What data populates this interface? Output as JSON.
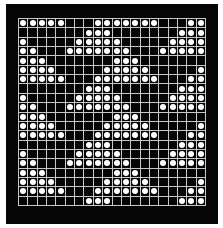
{
  "board": {
    "rows": 20,
    "cols": 20,
    "colors": {
      "background": "#050505",
      "grid": "#c8c8c8",
      "piece": "#ffffff",
      "page": "#ffffff"
    },
    "cells": [
      "11111000111111100011",
      "00000001110000000111",
      "10000011111000001111",
      "11000111111100011111",
      "11100000001110000000",
      "11110000011111000001",
      "11111000111111100011",
      "00000001110000000111",
      "10000011111000001111",
      "11000111111100011111",
      "11100000001110000000",
      "11110000011111000001",
      "11111000111111100011",
      "00000001110000000111",
      "10000011111000001111",
      "11000111111100011111",
      "11100000001110000000",
      "11110000011111000001",
      "11111000111111100011",
      "00000001110000000111"
    ]
  }
}
